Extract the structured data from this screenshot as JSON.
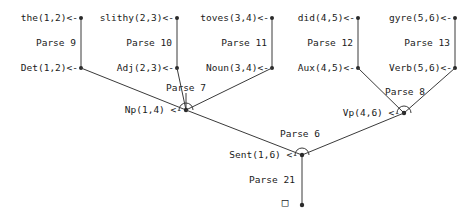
{
  "diagram": {
    "background_color": "#ffffff",
    "line_color": "#3a3a3a",
    "text_color": "#1a1a1a",
    "terminal_box_glyph": "□"
  },
  "words": [
    {
      "label": "the(1,2)<-"
    },
    {
      "label": "slithy(2,3)<-"
    },
    {
      "label": "toves(3,4)<-"
    },
    {
      "label": "did(4,5)<-"
    },
    {
      "label": "gyre(5,6)<-"
    }
  ],
  "word_parses": [
    {
      "label": "Parse 9"
    },
    {
      "label": "Parse 10"
    },
    {
      "label": "Parse 11"
    },
    {
      "label": "Parse 12"
    },
    {
      "label": "Parse 13"
    }
  ],
  "pos_tags": [
    {
      "label": "Det(1,2)<-"
    },
    {
      "label": "Adj(2,3)<-"
    },
    {
      "label": "Noun(3,4)<-"
    },
    {
      "label": "Aux(4,5)<-"
    },
    {
      "label": "Verb(5,6)<-"
    }
  ],
  "phrase_parses": [
    {
      "label": "Parse 7"
    },
    {
      "label": "Parse 8"
    }
  ],
  "phrases": [
    {
      "label": "Np(1,4) <-"
    },
    {
      "label": "Vp(4,6) <-"
    }
  ],
  "sentence_parse": {
    "label": "Parse 6"
  },
  "sentence": {
    "label": "Sent(1,6) <-"
  },
  "root_parse": {
    "label": "Parse 21"
  },
  "root_terminal": {
    "label": "□"
  }
}
